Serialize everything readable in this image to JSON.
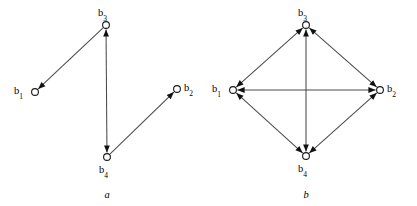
{
  "figure": {
    "width": 417,
    "height": 206,
    "background": "#ffffff",
    "edge_color": "#4a4a4a",
    "node_stroke_color": "#1a1a1a",
    "node_fill_color": "#ffffff",
    "arrowhead_color": "#111111"
  },
  "panels": [
    {
      "id": "a",
      "caption": "a",
      "caption_x": 107,
      "caption_y": 190,
      "nodes": [
        {
          "id": "b1",
          "base": "b",
          "sub": "1",
          "x": 35,
          "y": 92,
          "r": 3.4,
          "label_x": 14,
          "label_y": 86,
          "label_align": "left"
        },
        {
          "id": "b2",
          "base": "b",
          "sub": "2",
          "x": 177,
          "y": 89,
          "r": 3.4,
          "label_x": 184,
          "label_y": 83,
          "label_align": "left"
        },
        {
          "id": "b3",
          "base": "b",
          "sub": "3",
          "x": 106,
          "y": 25,
          "r": 3.4,
          "label_x": 98,
          "label_y": 8,
          "label_align": "left"
        },
        {
          "id": "b4",
          "base": "b",
          "sub": "4",
          "x": 107,
          "y": 157,
          "r": 3.4,
          "label_x": 99,
          "label_y": 165,
          "label_align": "left"
        }
      ],
      "edges": [
        {
          "from": "b3",
          "to": "b1",
          "arrow_at_to": true,
          "arrow_at_from": false
        },
        {
          "from": "b3",
          "to": "b4",
          "arrow_at_to": true,
          "arrow_at_from": true
        },
        {
          "from": "b4",
          "to": "b2",
          "arrow_at_to": true,
          "arrow_at_from": false
        }
      ]
    },
    {
      "id": "b",
      "caption": "b",
      "caption_x": 97,
      "caption_y": 190,
      "nodes": [
        {
          "id": "b1",
          "base": "b",
          "sub": "1",
          "x": 24,
          "y": 90,
          "r": 3.4,
          "label_x": 3,
          "label_y": 84,
          "label_align": "left"
        },
        {
          "id": "b2",
          "base": "b",
          "sub": "2",
          "x": 171,
          "y": 90,
          "r": 3.4,
          "label_x": 178,
          "label_y": 84,
          "label_align": "left"
        },
        {
          "id": "b3",
          "base": "b",
          "sub": "3",
          "x": 97,
          "y": 25,
          "r": 3.4,
          "label_x": 89,
          "label_y": 8,
          "label_align": "left"
        },
        {
          "id": "b4",
          "base": "b",
          "sub": "4",
          "x": 97,
          "y": 156,
          "r": 3.4,
          "label_x": 89,
          "label_y": 164,
          "label_align": "left"
        }
      ],
      "edges": [
        {
          "from": "b1",
          "to": "b3",
          "arrow_at_to": true,
          "arrow_at_from": true
        },
        {
          "from": "b3",
          "to": "b2",
          "arrow_at_to": true,
          "arrow_at_from": true
        },
        {
          "from": "b2",
          "to": "b4",
          "arrow_at_to": true,
          "arrow_at_from": true
        },
        {
          "from": "b4",
          "to": "b1",
          "arrow_at_to": true,
          "arrow_at_from": true
        },
        {
          "from": "b1",
          "to": "b2",
          "arrow_at_to": true,
          "arrow_at_from": true
        },
        {
          "from": "b3",
          "to": "b4",
          "arrow_at_to": true,
          "arrow_at_from": true
        }
      ]
    }
  ]
}
